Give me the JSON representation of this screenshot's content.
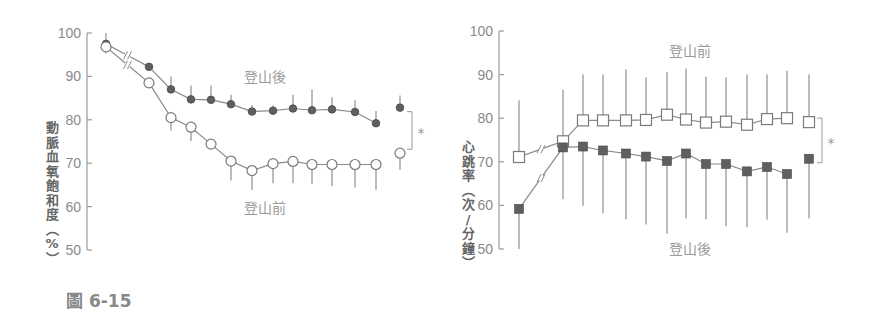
{
  "figure": {
    "caption": "圖 6-15"
  },
  "chart_data": [
    {
      "type": "line",
      "title": "",
      "xlabel": "",
      "ylabel": "動脈血氧飽和度（%）",
      "ylim": [
        50,
        100
      ],
      "yticks": [
        50,
        60,
        70,
        80,
        90,
        100
      ],
      "x": [
        1,
        2,
        3,
        4,
        5,
        6,
        7,
        8,
        9,
        10,
        11,
        12,
        13,
        "final"
      ],
      "series": [
        {
          "name": "登山後",
          "marker": "filled-circle",
          "values": [
            97.5,
            92.2,
            87.0,
            84.7,
            84.6,
            83.6,
            81.9,
            82.1,
            82.6,
            82.2,
            82.4,
            81.8,
            79.2,
            82.8
          ],
          "error_up": [
            2.5,
            0,
            3.0,
            3.2,
            3.3,
            2.2,
            1.5,
            1.2,
            3.2,
            4.8,
            2.8,
            2.7,
            2.8,
            2.8
          ]
        },
        {
          "name": "登山前",
          "marker": "open-circle",
          "values": [
            96.8,
            88.5,
            80.5,
            78.3,
            74.4,
            70.5,
            68.3,
            69.9,
            70.4,
            69.7,
            69.7,
            69.7,
            69.7,
            72.3
          ],
          "error_down": [
            1.5,
            0,
            3.0,
            3.2,
            0,
            4.5,
            4.5,
            4.5,
            5.0,
            4.5,
            5.0,
            5.3,
            5.8,
            3.8
          ]
        }
      ],
      "annotations": [
        "登山後",
        "登山前",
        "*"
      ],
      "axis_break": true
    },
    {
      "type": "line",
      "title": "",
      "xlabel": "",
      "ylabel": "心跳率（次/分鐘）",
      "ylim": [
        50,
        100
      ],
      "yticks": [
        50,
        60,
        70,
        80,
        90,
        100
      ],
      "x": [
        1,
        2,
        3,
        4,
        5,
        6,
        7,
        8,
        9,
        10,
        11,
        12,
        13,
        "final"
      ],
      "series": [
        {
          "name": "登山前",
          "marker": "open-square",
          "values": [
            71.1,
            74.7,
            79.5,
            79.5,
            79.5,
            79.6,
            80.8,
            79.7,
            79.0,
            79.2,
            78.5,
            79.8,
            80.0,
            79.1
          ],
          "error_up": [
            13.0,
            11.8,
            10.5,
            10.5,
            11.7,
            9.8,
            9.8,
            11.7,
            10.5,
            10.2,
            11.5,
            10.2,
            10.9,
            10.9
          ]
        },
        {
          "name": "登山後",
          "marker": "filled-square",
          "values": [
            59.2,
            73.3,
            73.5,
            72.6,
            71.9,
            71.2,
            70.2,
            71.9,
            69.5,
            69.5,
            67.8,
            68.8,
            67.2,
            70.7
          ],
          "error_down": [
            9.2,
            11.9,
            13.6,
            14.4,
            15.1,
            15.6,
            16.7,
            14.9,
            12.7,
            14.3,
            12.8,
            12.1,
            13.5,
            13.7
          ]
        }
      ],
      "annotations": [
        "登山前",
        "登山後",
        "*"
      ],
      "axis_break": true
    }
  ],
  "labels": {
    "left_post": "登山後",
    "left_pre": "登山前",
    "right_pre": "登山前",
    "right_post": "登山後",
    "significance": "*",
    "left_ylabel_chars": [
      "動",
      "脈",
      "血",
      "氧",
      "飽",
      "和",
      "度",
      "︵",
      "%",
      "︶"
    ],
    "right_ylabel_chars": [
      "心",
      "跳",
      "率",
      "︵",
      "次",
      "/",
      "分",
      "鐘",
      "︶"
    ]
  },
  "colors": {
    "axis": "#9a9a9a",
    "filled_marker": "#5f5f5f",
    "line": "#8a8a8a",
    "text": "#8a8a8a"
  }
}
